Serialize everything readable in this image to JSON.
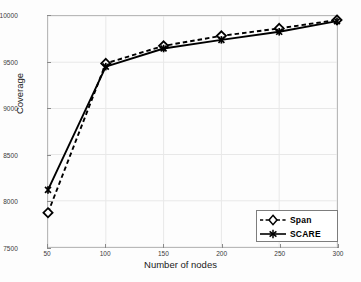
{
  "chart_data": {
    "type": "line",
    "title": "",
    "xlabel": "Number of nodes",
    "ylabel": "Coverage",
    "x": [
      50,
      100,
      150,
      200,
      250,
      300
    ],
    "xlim": [
      50,
      300
    ],
    "ylim": [
      7500,
      10000
    ],
    "xticks": [
      "50",
      "100",
      "150",
      "200",
      "250",
      "300"
    ],
    "yticks": [
      "10000",
      "9500",
      "9000",
      "8500",
      "8000",
      "7500"
    ],
    "grid": true,
    "legend_position": "lower right",
    "series": [
      {
        "name": "Span",
        "values": [
          7871,
          9487,
          9677,
          9785,
          9866,
          9957
        ],
        "linestyle": "dashed",
        "marker": "diamond",
        "color": "#000000"
      },
      {
        "name": "SCARE",
        "values": [
          8118,
          9452,
          9648,
          9742,
          9829,
          9944
        ],
        "linestyle": "solid",
        "marker": "star",
        "color": "#000000"
      }
    ]
  },
  "legend": {
    "items": [
      {
        "label": "Span"
      },
      {
        "label": "SCARE"
      }
    ]
  },
  "colors": {
    "line": "#000000",
    "grid": "#e8e8e8",
    "axis": "#8a8a8a",
    "background": "#fdfdfd",
    "tick_text": "#3a3a3a"
  }
}
